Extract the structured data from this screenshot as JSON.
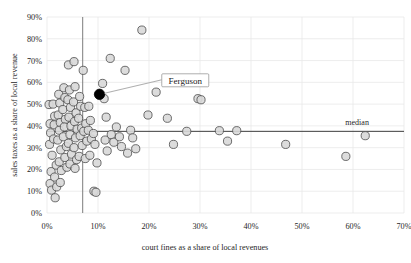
{
  "chart_data": {
    "type": "scatter",
    "title": "",
    "xlabel": "court fines as a share of local revenues",
    "ylabel": "sales taxes as a share of local revenue",
    "xlim": [
      0,
      70
    ],
    "ylim": [
      0,
      90
    ],
    "xticks": [
      "0%",
      "10%",
      "20%",
      "30%",
      "40%",
      "50%",
      "60%",
      "70%"
    ],
    "xtick_values": [
      0,
      10,
      20,
      30,
      40,
      50,
      60,
      70
    ],
    "yticks": [
      "0%",
      "10%",
      "20%",
      "30%",
      "40%",
      "50%",
      "60%",
      "70%",
      "80%",
      "90%"
    ],
    "ytick_values": [
      0,
      10,
      20,
      30,
      40,
      50,
      60,
      70,
      80,
      90
    ],
    "grid": true,
    "legend": "none",
    "annotations": [
      {
        "name": "median-line-label",
        "text": "median",
        "x": 58.5,
        "y": 40.5
      },
      {
        "name": "ferguson-callout",
        "text": "Ferguson",
        "x": 22.5,
        "y": 63.0
      }
    ],
    "reference_lines": [
      {
        "name": "median-horizontal",
        "orientation": "horizontal",
        "value": 37.5,
        "label": "median"
      },
      {
        "name": "median-vertical",
        "orientation": "vertical",
        "value": 7.0,
        "label": ""
      }
    ],
    "highlighted_point": {
      "label": "Ferguson",
      "x": 10.3,
      "y": 54.5,
      "color": "#000000"
    },
    "point_color": "#d8d8d8",
    "point_edge_color": "#4a4a4a",
    "series": [
      {
        "name": "municipalities",
        "points": [
          [
            0.4,
            49.8
          ],
          [
            0.6,
            41.0
          ],
          [
            0.7,
            36.8
          ],
          [
            0.5,
            31.5
          ],
          [
            0.8,
            19.0
          ],
          [
            0.6,
            13.5
          ],
          [
            0.9,
            10.5
          ],
          [
            1.6,
            7.0
          ],
          [
            1.2,
            50.0
          ],
          [
            1.5,
            44.5
          ],
          [
            1.4,
            40.5
          ],
          [
            1.3,
            34.0
          ],
          [
            1.0,
            26.5
          ],
          [
            1.8,
            22.0
          ],
          [
            1.5,
            16.5
          ],
          [
            1.9,
            12.0
          ],
          [
            2.3,
            54.5
          ],
          [
            2.5,
            50.5
          ],
          [
            2.2,
            45.0
          ],
          [
            2.6,
            41.5
          ],
          [
            2.4,
            38.0
          ],
          [
            2.1,
            33.5
          ],
          [
            2.7,
            29.0
          ],
          [
            2.4,
            23.5
          ],
          [
            2.8,
            19.5
          ],
          [
            2.6,
            14.0
          ],
          [
            3.3,
            57.5
          ],
          [
            3.5,
            53.0
          ],
          [
            3.1,
            47.5
          ],
          [
            3.6,
            43.0
          ],
          [
            3.4,
            39.5
          ],
          [
            3.2,
            35.0
          ],
          [
            3.8,
            30.5
          ],
          [
            3.5,
            25.5
          ],
          [
            3.9,
            21.0
          ],
          [
            4.2,
            68.0
          ],
          [
            4.4,
            56.5
          ],
          [
            4.1,
            52.0
          ],
          [
            4.6,
            48.5
          ],
          [
            4.3,
            44.0
          ],
          [
            4.7,
            40.0
          ],
          [
            4.5,
            36.0
          ],
          [
            4.2,
            32.0
          ],
          [
            4.8,
            27.0
          ],
          [
            4.5,
            22.5
          ],
          [
            5.3,
            69.5
          ],
          [
            5.5,
            58.0
          ],
          [
            5.2,
            51.0
          ],
          [
            5.7,
            46.0
          ],
          [
            5.4,
            42.0
          ],
          [
            5.9,
            38.5
          ],
          [
            5.6,
            34.5
          ],
          [
            5.3,
            30.0
          ],
          [
            5.8,
            24.5
          ],
          [
            5.5,
            20.5
          ],
          [
            6.4,
            53.5
          ],
          [
            6.6,
            49.0
          ],
          [
            6.2,
            43.5
          ],
          [
            6.8,
            39.0
          ],
          [
            6.5,
            35.5
          ],
          [
            6.9,
            31.0
          ],
          [
            6.3,
            26.0
          ],
          [
            7.1,
            65.5
          ],
          [
            7.4,
            48.5
          ],
          [
            7.6,
            41.0
          ],
          [
            7.2,
            37.5
          ],
          [
            7.8,
            33.0
          ],
          [
            7.5,
            25.0
          ],
          [
            8.2,
            49.0
          ],
          [
            8.5,
            42.5
          ],
          [
            8.1,
            38.0
          ],
          [
            8.7,
            34.0
          ],
          [
            8.4,
            26.5
          ],
          [
            9.1,
            36.5
          ],
          [
            9.4,
            31.5
          ],
          [
            9.8,
            23.0
          ],
          [
            9.2,
            10.0
          ],
          [
            9.6,
            9.5
          ],
          [
            10.9,
            59.5
          ],
          [
            11.2,
            52.5
          ],
          [
            11.6,
            44.0
          ],
          [
            11.4,
            33.5
          ],
          [
            11.8,
            28.5
          ],
          [
            12.4,
            71.0
          ],
          [
            12.6,
            36.0
          ],
          [
            13.1,
            32.5
          ],
          [
            13.6,
            39.5
          ],
          [
            14.2,
            35.0
          ],
          [
            14.6,
            30.5
          ],
          [
            15.3,
            65.5
          ],
          [
            15.8,
            27.5
          ],
          [
            16.4,
            38.0
          ],
          [
            16.8,
            34.5
          ],
          [
            17.4,
            29.5
          ],
          [
            18.6,
            84.0
          ],
          [
            19.8,
            45.0
          ],
          [
            21.4,
            55.5
          ],
          [
            23.6,
            43.5
          ],
          [
            24.8,
            31.5
          ],
          [
            27.4,
            37.5
          ],
          [
            29.6,
            52.5
          ],
          [
            30.2,
            52.0
          ],
          [
            33.8,
            37.8
          ],
          [
            37.2,
            37.8
          ],
          [
            35.4,
            33.0
          ],
          [
            46.8,
            31.5
          ],
          [
            58.6,
            26.0
          ],
          [
            62.4,
            35.5
          ]
        ]
      }
    ]
  },
  "axis": {
    "x_title": "court fines as a share of local revenues",
    "y_title": "sales taxes as a share of local revenue"
  }
}
